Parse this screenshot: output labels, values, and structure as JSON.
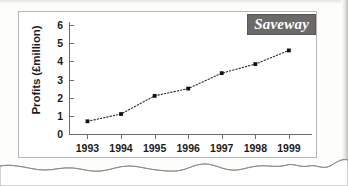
{
  "badge": {
    "label": "Saveway"
  },
  "chart_data": {
    "type": "line",
    "title": "Saveway",
    "xlabel": "",
    "ylabel": "Profits (£million)",
    "categories": [
      "1993",
      "1994",
      "1995",
      "1996",
      "1997",
      "1998",
      "1999"
    ],
    "x": [
      1993,
      1994,
      1995,
      1996,
      1997,
      1998,
      1999
    ],
    "values": [
      0.7,
      1.1,
      2.1,
      2.5,
      3.35,
      3.85,
      4.6
    ],
    "series": [
      {
        "name": "Profits",
        "values": [
          0.7,
          1.1,
          2.1,
          2.5,
          3.35,
          3.85,
          4.6
        ]
      }
    ],
    "ylim": [
      0,
      6
    ],
    "yticks": [
      0,
      1,
      2,
      3,
      4,
      5,
      6
    ],
    "ytick_labels": [
      "0",
      "1",
      "2",
      "3",
      "4",
      "5",
      "6"
    ],
    "xtick_labels": [
      "1993",
      "1994",
      "1995",
      "1996",
      "1997",
      "1998",
      "1999"
    ],
    "grid": false,
    "legend": "none",
    "marker": "square",
    "line_style": "dotted",
    "line_color": "#2b2b2b",
    "marker_color": "#111111"
  },
  "colors": {
    "badge_background": "#6b6a68",
    "badge_text": "#ffffff",
    "axis": "#6e6d6b",
    "frame": "#b9b8b5",
    "page": "#fdfdfc",
    "text": "#1b1b1b"
  }
}
